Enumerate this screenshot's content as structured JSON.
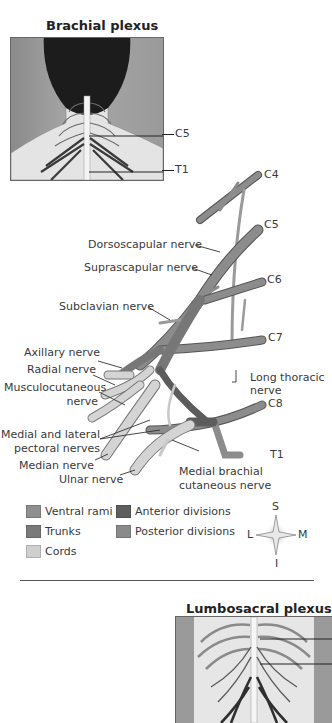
{
  "insets": {
    "brachial": {
      "title": "Brachial plexus",
      "markers": [
        "C5",
        "T1"
      ]
    },
    "lumbosacral": {
      "title": "Lumbosacral plexus"
    }
  },
  "diagram": {
    "roots": [
      "C4",
      "C5",
      "C6",
      "C7",
      "C8",
      "T1"
    ],
    "labels": {
      "dorsoscapular": "Dorsoscapular nerve",
      "suprascapular": "Suprascapular nerve",
      "subclavian": "Subclavian nerve",
      "axillary": "Axillary nerve",
      "radial": "Radial nerve",
      "musculocutaneous_1": "Musculocutaneous",
      "musculocutaneous_2": "nerve",
      "pectoral_1": "Medial and lateral",
      "pectoral_2": "pectoral nerves",
      "median": "Median nerve",
      "ulnar": "Ulnar nerve",
      "long_thoracic_1": "Long thoracic",
      "long_thoracic_2": "nerve",
      "medial_brachial_1": "Medial brachial",
      "medial_brachial_2": "cutaneous nerve"
    }
  },
  "legend": {
    "items": [
      {
        "label": "Ventral rami",
        "color": "#8f8f8f"
      },
      {
        "label": "Trunks",
        "color": "#7a7a7a"
      },
      {
        "label": "Cords",
        "color": "#cfcfcf"
      },
      {
        "label": "Anterior divisions",
        "color": "#5e5e5e"
      },
      {
        "label": "Posterior divisions",
        "color": "#8a8a8a"
      }
    ]
  },
  "compass": {
    "top": "S",
    "bottom": "I",
    "left": "L",
    "right": "M"
  },
  "colors": {
    "rami": "#8c8c8c",
    "trunk": "#777777",
    "cord": "#d4d4d4",
    "anterior": "#5c5c5c",
    "nerve_light": "#e2e2e2",
    "outline": "#555555"
  }
}
